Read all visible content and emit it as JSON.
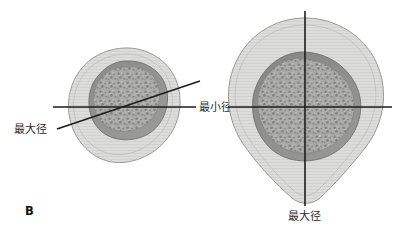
{
  "figure": {
    "panel_letter": "B",
    "background_color": "#ffffff",
    "width": 411,
    "height": 241
  },
  "palette": {
    "outer_fill": "#d9d9d7",
    "outer_stroke": "#8e8e8c",
    "inner_contour_stroke": "#b9b9b6",
    "mass_rim_fill": "#8f8f8e",
    "mass_rim_stroke": "#6f6f6e",
    "mass_core_fill": "#a8a8a6",
    "speckle_dark": "#6e6e6d",
    "speckle_light": "#c9c9c7",
    "line_color": "#1d1d1d",
    "text_color": "#2b2b2b"
  },
  "left_panel": {
    "name": "oblique-section",
    "labels": {
      "major_axis": "最大径",
      "minor_axis": "最小径"
    },
    "lines": [
      {
        "name": "minor-axis-line",
        "label": "最小径",
        "orientation": "horizontal",
        "x1": 53,
        "y1": 107,
        "x2": 196,
        "y2": 107
      },
      {
        "name": "major-axis-line",
        "label": "最大径",
        "orientation": "oblique",
        "x1": 57,
        "y1": 129,
        "x2": 200,
        "y2": 81
      }
    ],
    "label_positions": {
      "major_axis": {
        "x": 14,
        "y": 133
      },
      "minor_axis": {
        "x": 199,
        "y": 111
      }
    }
  },
  "right_panel": {
    "name": "pear-shaped-section",
    "labels": {
      "major_axis": "最大径",
      "minor_axis": "最小径"
    },
    "lines": [
      {
        "name": "minor-axis-line",
        "label": "最小径",
        "orientation": "horizontal",
        "x1": 228,
        "y1": 107,
        "x2": 392,
        "y2": 107
      },
      {
        "name": "major-axis-line",
        "label": "最大径",
        "orientation": "vertical",
        "x1": 305,
        "y1": 11,
        "x2": 305,
        "y2": 206
      }
    ],
    "label_positions": {
      "major_axis": {
        "x": 288,
        "y": 220
      }
    }
  }
}
